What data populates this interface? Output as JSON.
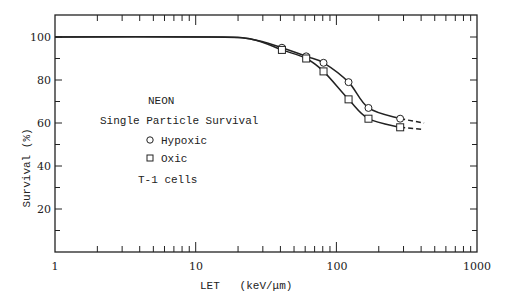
{
  "chart_data": {
    "type": "line",
    "title": "NEON Single Particle Survival",
    "xlabel": "LET   (keV/μm)",
    "ylabel": "Survival (%)",
    "xscale": "log",
    "xlim": [
      1,
      1000
    ],
    "ylim": [
      0,
      110
    ],
    "x_ticks": [
      "1",
      "10",
      "100",
      "1000"
    ],
    "y_ticks": [
      "20",
      "40",
      "60",
      "80",
      "100"
    ],
    "grid": false,
    "legend": {
      "position": "upper-left inside",
      "heading": "NEON",
      "subheading": "Single Particle Survival",
      "entries": [
        {
          "marker": "circle",
          "label": "Hypoxic"
        },
        {
          "marker": "square",
          "label": "Oxic"
        }
      ],
      "footer": "T-1 cells"
    },
    "series": [
      {
        "name": "Hypoxic",
        "marker": "circle",
        "x": [
          41,
          61,
          81,
          122,
          169,
          284
        ],
        "values": [
          95,
          91,
          88,
          79,
          67,
          62
        ],
        "extrapolated_to": [
          420,
          60
        ]
      },
      {
        "name": "Oxic",
        "marker": "square",
        "x": [
          41,
          61,
          81,
          122,
          169,
          284
        ],
        "values": [
          94,
          90,
          84,
          71,
          62,
          58
        ],
        "extrapolated_to": [
          420,
          57
        ]
      }
    ],
    "fit_curve_plateau": 100,
    "plateau_until_let": 13
  },
  "labels": {
    "neon": "NEON",
    "subtitle": "Single Particle Survival",
    "hypoxic": "Hypoxic",
    "oxic": "Oxic",
    "cells": "T-1 cells",
    "xlabel": "LET   (keV/μm)",
    "ylabel": "Survival (%)",
    "x1": "1",
    "x10": "10",
    "x100": "100",
    "x1000": "1000",
    "y20": "20",
    "y40": "40",
    "y60": "60",
    "y80": "80",
    "y100": "100"
  },
  "colors": {
    "ink": "#222222",
    "background": "#ffffff"
  }
}
